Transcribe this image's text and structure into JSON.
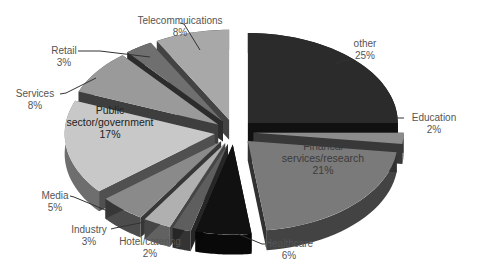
{
  "chart_data": {
    "type": "pie",
    "style": "3d-exploded",
    "title": "",
    "start_angle_deg": 0,
    "direction": "clockwise",
    "slices": [
      {
        "label": "other",
        "value": 25,
        "display": "25%",
        "color": "#2b2b2b"
      },
      {
        "label": "Education",
        "value": 2,
        "display": "2%",
        "color": "#8c8c8c"
      },
      {
        "label": "Financal services/research",
        "value": 21,
        "display": "21%",
        "color": "#7a7a7a"
      },
      {
        "label": "Healthcare",
        "value": 6,
        "display": "6%",
        "color": "#111111"
      },
      {
        "label": "Hotel/catering",
        "value": 2,
        "display": "2%",
        "color": "#5e5e5e"
      },
      {
        "label": "Industry",
        "value": 3,
        "display": "3%",
        "color": "#b0b0b0"
      },
      {
        "label": "Media",
        "value": 5,
        "display": "5%",
        "color": "#8a8a8a"
      },
      {
        "label": "Public sector/government",
        "value": 17,
        "display": "17%",
        "color": "#c8c8c8"
      },
      {
        "label": "Services",
        "value": 8,
        "display": "8%",
        "color": "#9a9a9a"
      },
      {
        "label": "Retail",
        "value": 3,
        "display": "3%",
        "color": "#6f6f6f"
      },
      {
        "label": "Telecommuications",
        "value": 8,
        "display": "8%",
        "color": "#a8a8a8"
      }
    ],
    "legend": "none",
    "data_labels": "category-and-percent"
  },
  "labels": {
    "other": {
      "name": "other",
      "pct": "25%"
    },
    "education": {
      "name": "Education",
      "pct": "2%"
    },
    "financial": {
      "name1": "Financal",
      "name2": "services/research",
      "pct": "21%"
    },
    "healthcare": {
      "name": "Healthcare",
      "pct": "6%"
    },
    "hotel": {
      "name": "Hotel/catering",
      "pct": "2%"
    },
    "industry": {
      "name": "Industry",
      "pct": "3%"
    },
    "media": {
      "name": "Media",
      "pct": "5%"
    },
    "public": {
      "name1": "Public",
      "name2": "sector/government",
      "pct": "17%"
    },
    "services": {
      "name": "Services",
      "pct": "8%"
    },
    "retail": {
      "name": "Retail",
      "pct": "3%"
    },
    "telecom": {
      "name": "Telecommuications",
      "pct": "8%"
    }
  }
}
